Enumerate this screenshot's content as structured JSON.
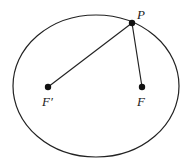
{
  "diagram": {
    "type": "ellipse-foci",
    "colors": {
      "stroke": "#222222",
      "background": "#ffffff"
    },
    "ellipse": {
      "cx": 96,
      "cy": 86,
      "rx": 83,
      "ry": 71
    },
    "points": [
      {
        "id": "P",
        "label": "P",
        "x": 132,
        "y": 23
      },
      {
        "id": "F_prime",
        "label": "F′",
        "x": 48,
        "y": 87
      },
      {
        "id": "F",
        "label": "F",
        "x": 142,
        "y": 87
      }
    ],
    "segments": [
      {
        "from": "P",
        "to": "F_prime"
      },
      {
        "from": "P",
        "to": "F"
      }
    ],
    "labels": {
      "p": "P",
      "f_prime": "F′",
      "f": "F"
    }
  }
}
